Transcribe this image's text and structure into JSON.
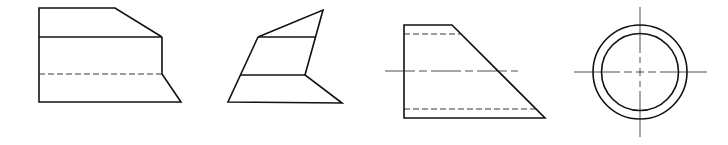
{
  "diagram": {
    "type": "technical-drawing-views",
    "colors": {
      "line": "#111111",
      "background": "#ffffff"
    },
    "views": [
      {
        "id": "view-1",
        "description": "front view with chamfered top-right and sloped base, one hidden line"
      },
      {
        "id": "view-2",
        "description": "oblique quadrilateral stacked view"
      },
      {
        "id": "view-3",
        "description": "trapezoid with two hidden lines and a centerline"
      },
      {
        "id": "view-4",
        "description": "two concentric circles with crossed centerlines"
      }
    ]
  }
}
